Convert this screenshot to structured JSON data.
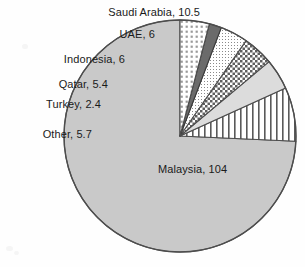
{
  "chart_data": {
    "type": "pie",
    "title": "",
    "subtitle": "",
    "xlabel": "",
    "ylabel": "",
    "legend_position": "none",
    "grid": false,
    "start_angle_deg": 90,
    "direction": "counterclockwise",
    "total": 139.99999999999997,
    "categories": [
      "Malaysia",
      "Saudi Arabia",
      "UAE",
      "Indonesia",
      "Qatar",
      "Turkey",
      "Other"
    ],
    "values": [
      104,
      10.5,
      6,
      6,
      5.4,
      2.4,
      5.7
    ],
    "labels": [
      "Malaysia, 104",
      "Saudi Arabia, 10.5",
      "UAE, 6",
      "Indonesia, 6",
      "Qatar, 5.4",
      "Turkey, 2.4",
      "Other, 5.7"
    ],
    "slices": [
      {
        "name": "Malaysia",
        "value": 104,
        "label": "Malaysia, 104",
        "fill_style": "solid-light-gray",
        "fill_color": "#c9c9c9",
        "stroke_color": "#4d4d4d",
        "label_position": "inside"
      },
      {
        "name": "Saudi Arabia",
        "value": 10.5,
        "label": "Saudi Arabia, 10.5",
        "fill_style": "vertical-lines",
        "fill_color": "#ffffff",
        "stroke_color": "#4d4d4d",
        "label_position": "outside-top"
      },
      {
        "name": "UAE",
        "value": 6,
        "label": "UAE, 6",
        "fill_style": "solid-pale-gray",
        "fill_color": "#dcdcdc",
        "stroke_color": "#4d4d4d",
        "label_position": "outside-upper-left"
      },
      {
        "name": "Indonesia",
        "value": 6,
        "label": "Indonesia, 6",
        "fill_style": "checkerboard",
        "fill_color": "#8f8f8f",
        "stroke_color": "#4d4d4d",
        "label_position": "outside-left"
      },
      {
        "name": "Qatar",
        "value": 5.4,
        "label": "Qatar, 5.4",
        "fill_style": "fine-dots",
        "fill_color": "#ffffff",
        "stroke_color": "#4d4d4d",
        "label_position": "outside-left"
      },
      {
        "name": "Turkey",
        "value": 2.4,
        "label": "Turkey, 2.4",
        "fill_style": "solid-dark-gray",
        "fill_color": "#6b6b6b",
        "stroke_color": "#3a3a3a",
        "label_position": "outside-left"
      },
      {
        "name": "Other",
        "value": 5.7,
        "label": "Other, 5.7",
        "fill_style": "square-dot-grid",
        "fill_color": "#ffffff",
        "stroke_color": "#4d4d4d",
        "label_position": "outside-lower-left"
      }
    ],
    "geometry": {
      "center_x": 180,
      "center_y": 136,
      "radius": 116
    },
    "colors": {
      "background": "#fefefe",
      "outline": "#4d4d4d",
      "text": "#1a1a1a"
    }
  }
}
